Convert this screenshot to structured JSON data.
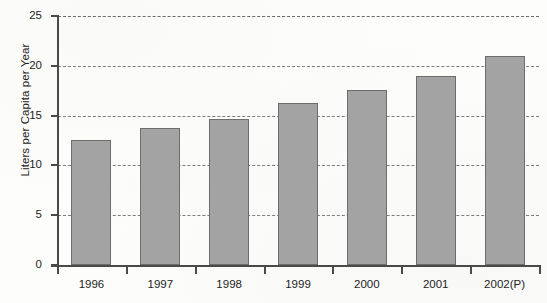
{
  "chart_data": {
    "type": "bar",
    "title": "",
    "subtitle": "",
    "xlabel": "",
    "ylabel": "Liters per Capita per Year",
    "categories": [
      "1996",
      "1997",
      "1998",
      "1999",
      "2000",
      "2001",
      "2002(P)"
    ],
    "values": [
      12.6,
      13.8,
      14.7,
      16.3,
      17.6,
      19.0,
      21.0
    ],
    "ylim": [
      0,
      25
    ],
    "ytick_labels": [
      "0",
      "5",
      "10",
      "15",
      "20",
      "25"
    ],
    "ytick_values": [
      0,
      5,
      10,
      15,
      20,
      25
    ],
    "grid": "horizontal-dashed",
    "legend": "none",
    "bar_color": "#a3a3a3",
    "bar_edge_color": "#6d6d6d",
    "axis_color": "#4a4a4a",
    "gridline_color": "#7d7d7d",
    "background_color": "#fdfdfc"
  }
}
